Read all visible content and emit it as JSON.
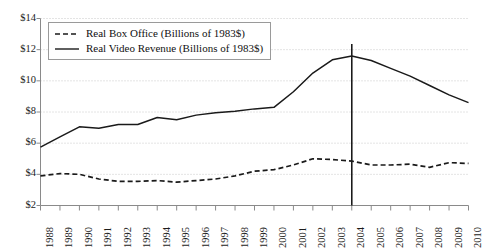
{
  "chart_data": {
    "type": "line",
    "title": "",
    "xlabel": "",
    "ylabel": "",
    "grid": true,
    "legend_position": "top-left",
    "xlim": [
      1988,
      2010
    ],
    "ylim": [
      2,
      14
    ],
    "ytick_labels": [
      "$2",
      "$4",
      "$6",
      "$8",
      "$10",
      "$12",
      "$14"
    ],
    "ytick_values": [
      2,
      4,
      6,
      8,
      10,
      12,
      14
    ],
    "categories": [
      1988,
      1989,
      1990,
      1991,
      1992,
      1993,
      1994,
      1995,
      1996,
      1997,
      1998,
      1999,
      2000,
      2001,
      2002,
      2003,
      2004,
      2005,
      2006,
      2007,
      2008,
      2009,
      2010
    ],
    "xtick_labels": [
      "1988",
      "1989",
      "1990",
      "1991",
      "1992",
      "1993",
      "1994",
      "1995",
      "1996",
      "1997",
      "1998",
      "1999",
      "2000",
      "2001",
      "2002",
      "2003",
      "2004",
      "2005",
      "2006",
      "2007",
      "2008",
      "2009",
      "2010"
    ],
    "series": [
      {
        "name": "Real Box Office (Billions of 1983$)",
        "style": "dashed",
        "color": "#1a1a1a",
        "values": [
          3.9,
          4.05,
          4.0,
          3.7,
          3.55,
          3.55,
          3.6,
          3.5,
          3.6,
          3.7,
          3.9,
          4.2,
          4.3,
          4.6,
          5.0,
          4.95,
          4.85,
          4.6,
          4.6,
          4.65,
          4.45,
          4.75,
          4.7
        ]
      },
      {
        "name": "Real Video Revenue (Billions of 1983$)",
        "style": "solid",
        "color": "#1a1a1a",
        "values": [
          5.75,
          6.4,
          7.05,
          6.95,
          7.2,
          7.2,
          7.65,
          7.5,
          7.8,
          7.95,
          8.05,
          8.2,
          8.3,
          9.3,
          10.5,
          11.35,
          11.6,
          11.3,
          10.8,
          10.3,
          9.7,
          9.1,
          8.6
        ]
      }
    ],
    "annotations": [
      {
        "type": "vertical-line",
        "at": 2004,
        "color": "#1a1a1a"
      }
    ]
  },
  "legend": {
    "items": [
      {
        "label": "Real Box Office (Billions of 1983$)",
        "style": "dashed"
      },
      {
        "label": "Real Video Revenue (Billions of 1983$)",
        "style": "solid"
      }
    ]
  },
  "colors": {
    "line": "#1a1a1a",
    "grid": "#c8c8c8",
    "axis": "#8a8a8a",
    "marker_line": "#1a1a1a"
  }
}
